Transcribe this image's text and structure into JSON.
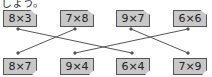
{
  "header_text": "しょう。",
  "top_cards": [
    {
      "label": "8×3",
      "x": 3,
      "y": 10
    },
    {
      "label": "7×8",
      "x": 60,
      "y": 10
    },
    {
      "label": "9×7",
      "x": 116,
      "y": 10
    },
    {
      "label": "6×6",
      "x": 173,
      "y": 10
    }
  ],
  "bottom_cards": [
    {
      "label": "8×7",
      "x": 3,
      "y": 58
    },
    {
      "label": "9×4",
      "x": 60,
      "y": 58
    },
    {
      "label": "6×4",
      "x": 116,
      "y": 58
    },
    {
      "label": "7×9",
      "x": 173,
      "y": 58
    }
  ],
  "connections": [
    {
      "from": "8×3",
      "to": "6×4"
    },
    {
      "from": "7×8",
      "to": "8×7"
    },
    {
      "from": "9×7",
      "to": "7×9"
    },
    {
      "from": "6×6",
      "to": "9×4"
    }
  ]
}
